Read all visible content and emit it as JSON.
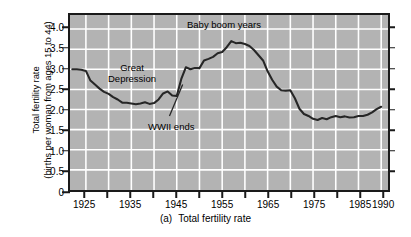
{
  "figure": {
    "caption_number": "(a)",
    "caption_text": "Total fertility rate"
  },
  "axes": {
    "ylabel_line1": "Total fertility rate",
    "ylabel_line2": "(births per woman from ages 15 to 44)",
    "y_tick_labels": [
      "4.0",
      "3.5",
      "3.0",
      "2.5",
      "2.0",
      "1.5",
      "1.0",
      "0.5",
      "0"
    ],
    "y_tick_values": [
      4.0,
      3.5,
      3.0,
      2.5,
      2.0,
      1.5,
      1.0,
      0.5,
      0
    ],
    "x_tick_labels": [
      "1925",
      "1935",
      "1945",
      "1955",
      "1965",
      "1975",
      "1985",
      "1990"
    ],
    "x_tick_label_values": [
      1925,
      1935,
      1945,
      1955,
      1965,
      1975,
      1985,
      1990
    ],
    "x_minor_ticks": [
      1925,
      1930,
      1935,
      1940,
      1945,
      1950,
      1955,
      1960,
      1965,
      1970,
      1975,
      1980,
      1985,
      1990
    ],
    "x_gridlines": [
      1925,
      1930,
      1935,
      1940,
      1945,
      1950,
      1955,
      1960,
      1965,
      1970,
      1975,
      1980,
      1985,
      1990
    ]
  },
  "annotations": [
    {
      "id": "baby-boom",
      "text": "Baby boom years"
    },
    {
      "id": "great-depression-l1",
      "text": "Great"
    },
    {
      "id": "great-depression-l2",
      "text": "Depression"
    },
    {
      "id": "wwii-ends",
      "text": "WWII ends"
    }
  ],
  "colors": {
    "plot_background": "#b3b3b3",
    "grid": "#ffffff",
    "curve": "#262626",
    "frame": "#1a1a1a",
    "page_background": "#ffffff",
    "text": "#000000"
  },
  "chart_data": {
    "type": "line",
    "title": "",
    "subtitle": "",
    "xlabel": "",
    "ylabel": "Total fertility rate (births per woman from ages 15 to 44)",
    "xlim": [
      1921.5,
      1991.5
    ],
    "ylim": [
      0,
      4.35
    ],
    "grid": true,
    "legend": false,
    "series": [
      {
        "name": "Total fertility rate",
        "x": [
          1922,
          1923,
          1924,
          1925,
          1926,
          1927,
          1928,
          1929,
          1930,
          1931,
          1932,
          1933,
          1934,
          1935,
          1936,
          1937,
          1938,
          1939,
          1940,
          1941,
          1942,
          1943,
          1944,
          1945,
          1946,
          1947,
          1948,
          1949,
          1950,
          1951,
          1952,
          1953,
          1954,
          1955,
          1956,
          1957,
          1958,
          1959,
          1960,
          1961,
          1962,
          1963,
          1964,
          1965,
          1966,
          1967,
          1968,
          1969,
          1970,
          1971,
          1972,
          1973,
          1974,
          1975,
          1976,
          1977,
          1978,
          1979,
          1980,
          1981,
          1982,
          1983,
          1984,
          1985,
          1986,
          1987,
          1988,
          1989,
          1990
        ],
        "y": [
          3.0,
          3.0,
          2.99,
          2.96,
          2.72,
          2.62,
          2.52,
          2.44,
          2.39,
          2.31,
          2.25,
          2.17,
          2.17,
          2.15,
          2.13,
          2.15,
          2.18,
          2.14,
          2.16,
          2.25,
          2.4,
          2.45,
          2.35,
          2.34,
          2.76,
          3.05,
          3.0,
          3.03,
          3.03,
          3.22,
          3.26,
          3.31,
          3.4,
          3.43,
          3.55,
          3.7,
          3.65,
          3.66,
          3.63,
          3.58,
          3.48,
          3.35,
          3.22,
          2.95,
          2.74,
          2.57,
          2.48,
          2.47,
          2.48,
          2.28,
          2.02,
          1.89,
          1.84,
          1.77,
          1.74,
          1.79,
          1.76,
          1.81,
          1.84,
          1.81,
          1.83,
          1.8,
          1.81,
          1.84,
          1.84,
          1.87,
          1.93,
          2.01,
          2.07
        ]
      }
    ],
    "annotations": [
      {
        "text": "Baby boom years",
        "x": 1956,
        "y": 4.12
      },
      {
        "text": "Great Depression",
        "x": 1934,
        "y": 3.18
      },
      {
        "text": "WWII ends",
        "x": 1942.5,
        "y": 1.72,
        "points_to_x": 1946.3,
        "points_to_y": 2.62
      }
    ]
  }
}
